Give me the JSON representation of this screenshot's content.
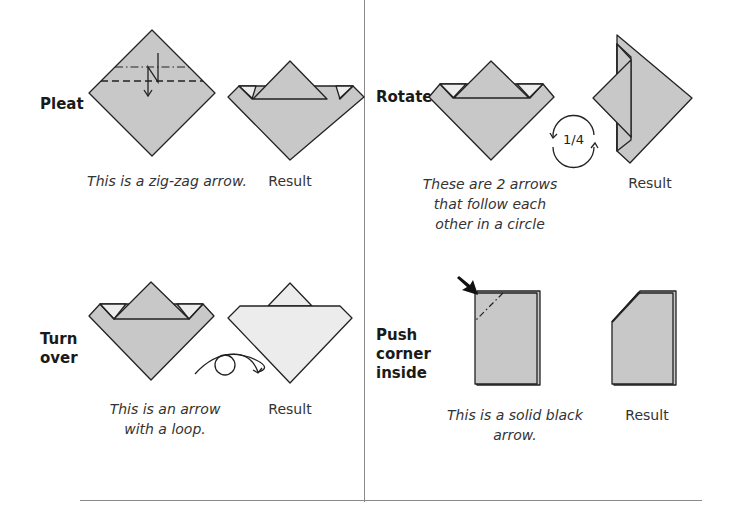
{
  "panels": {
    "pleat": {
      "label": "Pleat",
      "caption": "This is a zig-zag arrow.",
      "result_label": "Result"
    },
    "rotate": {
      "label": "Rotate",
      "caption_lines": [
        "These are 2 arrows",
        "that follow each",
        "other in a circle"
      ],
      "rotation_text": "1/4",
      "result_label": "Result"
    },
    "turn_over": {
      "label_lines": [
        "Turn",
        "over"
      ],
      "caption_lines": [
        "This is an arrow",
        "with a loop."
      ],
      "result_label": "Result"
    },
    "push_corner": {
      "label_lines": [
        "Push",
        "corner",
        "inside"
      ],
      "caption_lines": [
        "This is a solid black",
        "arrow."
      ],
      "result_label": "Result"
    }
  },
  "colors": {
    "paper": "#c8c8c8",
    "paper_back": "#ececec",
    "line": "#222222",
    "divider": "#8a8a8a"
  }
}
